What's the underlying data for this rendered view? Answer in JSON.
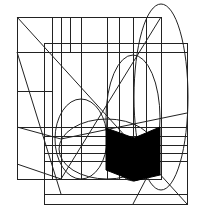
{
  "diagram": {
    "stroke_color": "#222222",
    "fill_color": "#000000",
    "background": "#ffffff",
    "rects": [
      {
        "name": "outer-left-rect",
        "x": 17,
        "y": 17,
        "w": 144,
        "h": 162
      },
      {
        "name": "inner-right-rect",
        "x": 44,
        "y": 43,
        "w": 143,
        "h": 161
      }
    ],
    "vertical_lines": [
      {
        "x": 52,
        "y1": 17,
        "y2": 179
      },
      {
        "x": 61,
        "y1": 17,
        "y2": 179
      },
      {
        "x": 70,
        "y1": 17,
        "y2": 52
      },
      {
        "x": 81,
        "y1": 17,
        "y2": 179
      },
      {
        "x": 107,
        "y1": 17,
        "y2": 179
      },
      {
        "x": 119,
        "y1": 17,
        "y2": 179
      },
      {
        "x": 133,
        "y1": 17,
        "y2": 179
      },
      {
        "x": 146,
        "y1": 17,
        "y2": 179
      }
    ],
    "horizontal_lines": [
      {
        "y": 52,
        "x1": 17,
        "x2": 187
      },
      {
        "y": 91,
        "x1": 17,
        "x2": 52
      },
      {
        "y": 127,
        "x1": 17,
        "x2": 187
      },
      {
        "y": 136,
        "x1": 44,
        "x2": 187
      },
      {
        "y": 145,
        "x1": 44,
        "x2": 187
      },
      {
        "y": 153,
        "x1": 44,
        "x2": 187
      },
      {
        "y": 161,
        "x1": 44,
        "x2": 187
      },
      {
        "y": 194,
        "x1": 44,
        "x2": 187
      }
    ],
    "diagonal_lines": [
      {
        "x1": 17,
        "y1": 17,
        "x2": 187,
        "y2": 204
      },
      {
        "x1": 17,
        "y1": 52,
        "x2": 61,
        "y2": 194
      },
      {
        "x1": 161,
        "y1": 17,
        "x2": 61,
        "y2": 179
      },
      {
        "x1": 17,
        "y1": 164,
        "x2": 61,
        "y2": 179
      },
      {
        "x1": 17,
        "y1": 127,
        "x2": 61,
        "y2": 139
      },
      {
        "x1": 61,
        "y1": 139,
        "x2": 187,
        "y2": 113
      },
      {
        "x1": 146,
        "y1": 179,
        "x2": 133,
        "y2": 204
      }
    ],
    "ellipses": [
      {
        "name": "tall-right-ellipse",
        "cx": 161,
        "cy": 97,
        "rx": 27,
        "ry": 93
      },
      {
        "name": "middle-ellipse",
        "cx": 133,
        "cy": 118,
        "rx": 27,
        "ry": 63
      },
      {
        "name": "left-ellipse",
        "cx": 81,
        "cy": 139,
        "rx": 26,
        "ry": 40
      },
      {
        "name": "bottom-arc-ellipse",
        "cx": 107,
        "cy": 149,
        "rx": 48,
        "ry": 30
      }
    ],
    "filled_polygon": {
      "name": "black-chevron-shape",
      "points": "106,128 134,138 160,127 160,175 134,181 106,170"
    }
  }
}
